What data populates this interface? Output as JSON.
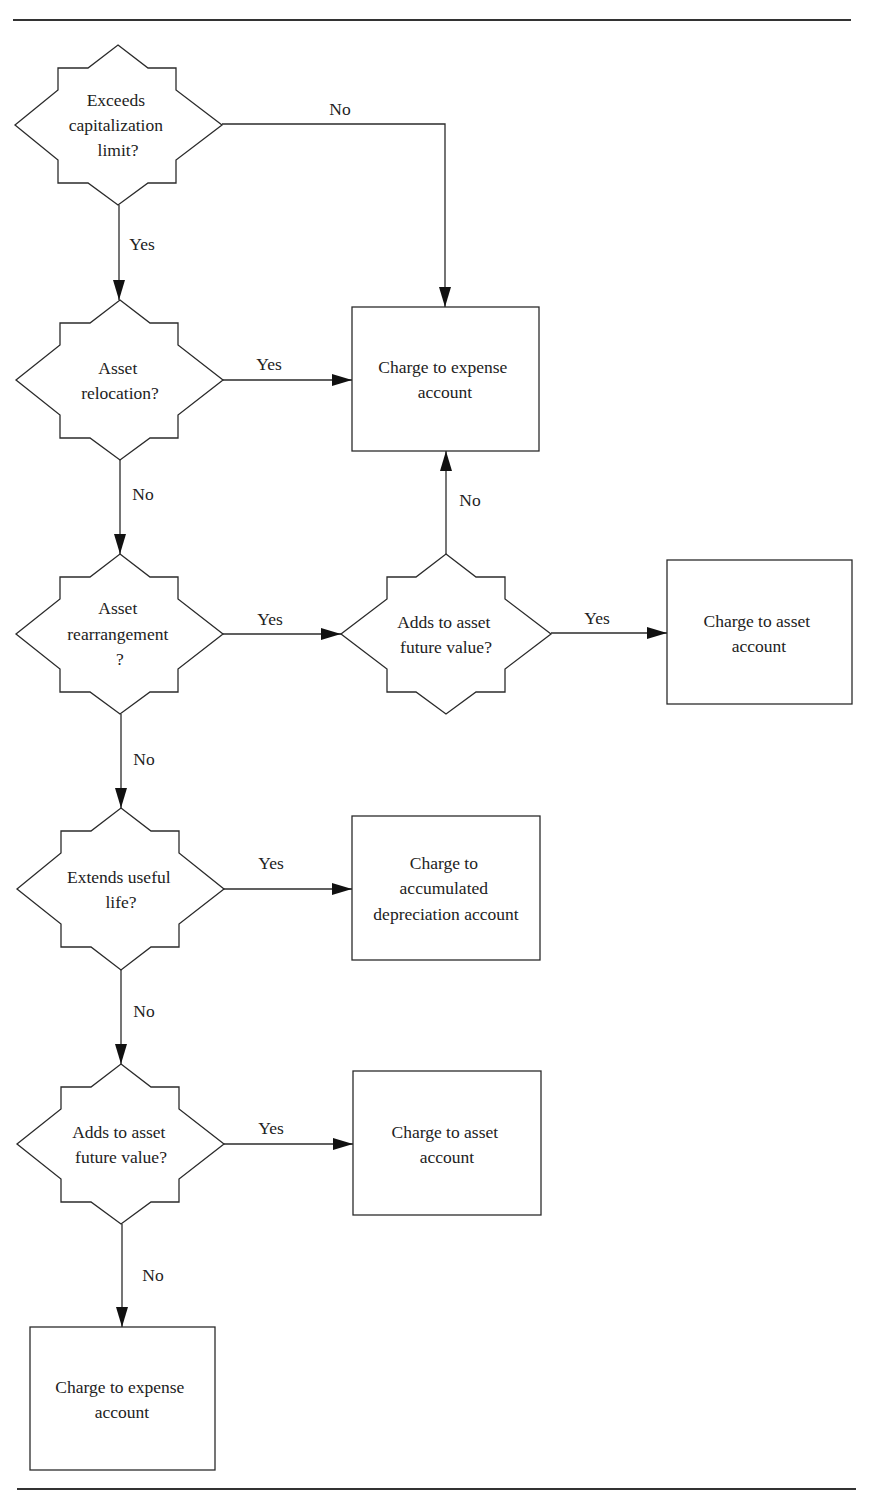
{
  "diagram": {
    "type": "flowchart",
    "decisions": [
      {
        "id": "d1",
        "lines": [
          "Exceeds",
          "capitalization",
          "limit?"
        ]
      },
      {
        "id": "d2",
        "lines": [
          "Asset",
          "relocation?"
        ]
      },
      {
        "id": "d3",
        "lines": [
          "Asset",
          "rearrangement",
          "?"
        ]
      },
      {
        "id": "d4",
        "lines": [
          "Adds to asset",
          "future value?"
        ]
      },
      {
        "id": "d5",
        "lines": [
          "Extends useful",
          "life?"
        ]
      },
      {
        "id": "d6",
        "lines": [
          "Adds to asset",
          "future value?"
        ]
      }
    ],
    "outcomes": [
      {
        "id": "b1",
        "lines": [
          "Charge to expense",
          "account"
        ]
      },
      {
        "id": "b2",
        "lines": [
          "Charge to asset",
          "account"
        ]
      },
      {
        "id": "b3",
        "lines": [
          "Charge to",
          "accumulated",
          "depreciation account"
        ]
      },
      {
        "id": "b4",
        "lines": [
          "Charge to asset",
          "account"
        ]
      },
      {
        "id": "b5",
        "lines": [
          "Charge to expense",
          "account"
        ]
      }
    ],
    "edges": [
      {
        "from": "d1",
        "to": "b1",
        "label": "No"
      },
      {
        "from": "d1",
        "to": "d2",
        "label": "Yes"
      },
      {
        "from": "d2",
        "to": "b1",
        "label": "Yes"
      },
      {
        "from": "d2",
        "to": "d3",
        "label": "No"
      },
      {
        "from": "d3",
        "to": "d4",
        "label": "Yes"
      },
      {
        "from": "d4",
        "to": "b1",
        "label": "No"
      },
      {
        "from": "d4",
        "to": "b2",
        "label": "Yes"
      },
      {
        "from": "d3",
        "to": "d5",
        "label": "No"
      },
      {
        "from": "d5",
        "to": "b3",
        "label": "Yes"
      },
      {
        "from": "d5",
        "to": "d6",
        "label": "No"
      },
      {
        "from": "d6",
        "to": "b4",
        "label": "Yes"
      },
      {
        "from": "d6",
        "to": "b5",
        "label": "No"
      }
    ]
  }
}
